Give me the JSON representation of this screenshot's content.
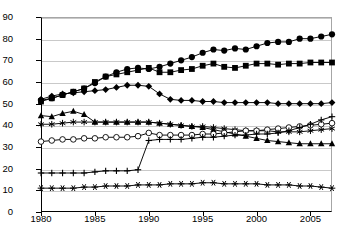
{
  "chart_data": {
    "type": "line",
    "title": "",
    "xlabel": "",
    "ylabel": "Electricity from coal (% of total)",
    "xlim": [
      1980,
      2007
    ],
    "ylim": [
      0,
      90
    ],
    "ytick_labels": [
      "0",
      "10",
      "20",
      "30",
      "40",
      "50",
      "60",
      "70",
      "80",
      "90"
    ],
    "yticks": [
      0,
      10,
      20,
      30,
      40,
      50,
      60,
      70,
      80,
      90
    ],
    "xtick_labels": [
      "1980",
      "1985",
      "1990",
      "1995",
      "2000",
      "2005"
    ],
    "xticks": [
      1980,
      1985,
      1990,
      1995,
      2000,
      2005
    ],
    "grid": "horizontal",
    "legend": "none",
    "x": [
      1980,
      1981,
      1982,
      1983,
      1984,
      1985,
      1986,
      1987,
      1988,
      1989,
      1990,
      1991,
      1992,
      1993,
      1994,
      1995,
      1996,
      1997,
      1998,
      1999,
      2000,
      2001,
      2002,
      2003,
      2004,
      2005,
      2006,
      2007
    ],
    "series": [
      {
        "name": "series-filled-circle",
        "marker": "filled-circle",
        "values": [
          51.5,
          52.5,
          54.0,
          55.5,
          57.0,
          59.5,
          62.5,
          64.5,
          66.0,
          66.5,
          66.0,
          67.0,
          68.5,
          70.0,
          71.5,
          73.5,
          75.0,
          74.5,
          75.5,
          75.0,
          76.5,
          78.0,
          78.5,
          78.5,
          80.0,
          80.0,
          81.0,
          82.0
        ]
      },
      {
        "name": "series-filled-square",
        "marker": "filled-square",
        "values": [
          51.0,
          52.5,
          54.0,
          55.5,
          57.0,
          60.0,
          62.5,
          63.5,
          64.5,
          65.5,
          66.5,
          64.5,
          64.5,
          65.5,
          66.0,
          67.5,
          68.5,
          67.0,
          66.5,
          67.5,
          68.5,
          68.5,
          68.0,
          68.5,
          68.5,
          69.0,
          69.0,
          69.0
        ]
      },
      {
        "name": "series-filled-diamond",
        "marker": "filled-diamond",
        "values": [
          52.0,
          53.5,
          54.5,
          55.0,
          55.5,
          56.0,
          56.5,
          57.5,
          58.5,
          58.5,
          58.0,
          54.5,
          52.0,
          51.5,
          51.5,
          51.0,
          51.0,
          50.5,
          50.5,
          50.5,
          50.5,
          50.5,
          50.0,
          50.0,
          50.0,
          50.0,
          50.0,
          50.5
        ]
      },
      {
        "name": "series-filled-triangle",
        "marker": "filled-triangle",
        "values": [
          44.5,
          44.0,
          45.5,
          46.5,
          45.0,
          41.5,
          41.5,
          41.5,
          41.5,
          41.5,
          41.5,
          41.0,
          40.5,
          40.0,
          39.5,
          39.0,
          38.0,
          37.0,
          36.0,
          35.0,
          34.0,
          33.0,
          32.5,
          32.0,
          31.5,
          31.5,
          31.5,
          31.5
        ]
      },
      {
        "name": "series-star",
        "marker": "star",
        "values": [
          40.5,
          40.5,
          41.0,
          41.5,
          41.5,
          41.5,
          41.5,
          41.5,
          41.5,
          41.5,
          41.5,
          41.0,
          40.5,
          40.0,
          39.5,
          39.5,
          39.0,
          38.5,
          38.0,
          37.5,
          37.5,
          37.5,
          37.0,
          37.0,
          37.0,
          37.5,
          38.0,
          38.5
        ]
      },
      {
        "name": "series-open-circle",
        "marker": "open-circle",
        "values": [
          32.5,
          33.0,
          33.5,
          33.5,
          34.0,
          34.0,
          34.5,
          34.5,
          34.5,
          35.0,
          36.5,
          35.5,
          35.5,
          35.5,
          35.5,
          36.0,
          36.0,
          36.5,
          37.0,
          37.5,
          37.5,
          38.0,
          38.5,
          39.0,
          39.5,
          40.0,
          40.5,
          41.0
        ]
      },
      {
        "name": "series-plus",
        "marker": "plus",
        "values": [
          18.0,
          18.0,
          18.0,
          18.0,
          18.0,
          18.5,
          19.0,
          19.0,
          19.0,
          19.5,
          33.0,
          33.5,
          33.5,
          33.5,
          34.0,
          34.5,
          34.5,
          35.0,
          35.5,
          35.5,
          36.0,
          36.0,
          36.5,
          37.5,
          39.0,
          40.5,
          42.5,
          44.0
        ]
      },
      {
        "name": "series-asterisk",
        "marker": "asterisk",
        "values": [
          11.0,
          11.0,
          11.0,
          11.0,
          11.5,
          11.5,
          12.0,
          12.0,
          12.0,
          12.5,
          12.5,
          12.5,
          13.0,
          13.0,
          13.0,
          13.5,
          13.5,
          13.0,
          13.0,
          13.0,
          13.0,
          12.5,
          12.5,
          12.5,
          12.0,
          12.0,
          11.5,
          11.0
        ]
      }
    ]
  }
}
